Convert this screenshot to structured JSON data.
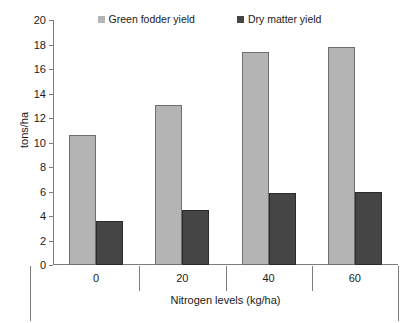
{
  "chart_data": {
    "type": "bar",
    "title": "",
    "xlabel": "Nitrogen levels (kg/ha)",
    "ylabel": "tons/ha",
    "categories": [
      "0",
      "20",
      "40",
      "60"
    ],
    "series": [
      {
        "name": "Green fodder yield",
        "color": "#b4b4b4",
        "values": [
          10.6,
          13.1,
          17.4,
          17.8
        ]
      },
      {
        "name": "Dry matter yield",
        "color": "#454545",
        "values": [
          3.6,
          4.5,
          5.9,
          6.0
        ]
      }
    ],
    "ylim": [
      0,
      20
    ],
    "yticks": [
      0,
      2,
      4,
      6,
      8,
      10,
      12,
      14,
      16,
      18,
      20
    ],
    "ytick_labels": [
      "0",
      "2",
      "4",
      "6",
      "8",
      "10",
      "12",
      "14",
      "16",
      "18",
      "20"
    ],
    "grid": false,
    "legend_position": "top-center"
  }
}
